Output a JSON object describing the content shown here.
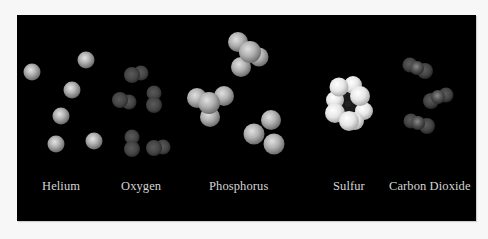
{
  "figure": {
    "background": "#000000",
    "labels": {
      "helium": "Helium",
      "oxygen": "Oxygen",
      "phosphorus": "Phosphorus",
      "sulfur": "Sulfur",
      "carbon_dioxide": "Carbon Dioxide"
    },
    "groups": [
      {
        "name": "Helium",
        "molecule": "He",
        "count": 6,
        "color": "#b8b8b8"
      },
      {
        "name": "Oxygen",
        "molecule": "O2",
        "count": 5,
        "color": "#4a4a4a"
      },
      {
        "name": "Phosphorus",
        "molecule": "P4",
        "count": 3,
        "color": "#b0b0b0"
      },
      {
        "name": "Sulfur",
        "molecule": "S8",
        "count": 1,
        "color": "#e6e6e6"
      },
      {
        "name": "Carbon Dioxide",
        "molecule": "CO2",
        "count": 3,
        "color": "#484848"
      }
    ]
  }
}
